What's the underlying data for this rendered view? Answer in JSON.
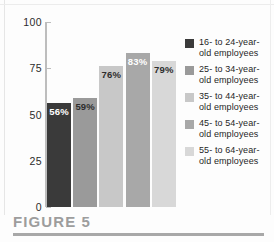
{
  "caption": {
    "label": "FIGURE 5"
  },
  "chart_data": {
    "type": "bar",
    "title": "",
    "xlabel": "",
    "ylabel": "",
    "ylim": [
      0,
      100
    ],
    "yticks": [
      "0",
      "25",
      "50",
      "75",
      "100"
    ],
    "grid": false,
    "legend_position": "right",
    "categories": [
      "16- to 24-year-old employees",
      "25- to 34-year-old employees",
      "35- to 44-year-old employees",
      "45- to 54-year-old employees",
      "55- to 64-year-old employees"
    ],
    "values": [
      56,
      59,
      76,
      83,
      79
    ],
    "data_labels": [
      "56%",
      "59%",
      "76%",
      "83%",
      "79%"
    ],
    "colors": [
      "#3a3a3a",
      "#9a9a9a",
      "#c8c8c8",
      "#a8a8a8",
      "#d8d8d8"
    ],
    "label_contrast": [
      "on-dark",
      "on-light",
      "on-light",
      "on-dark",
      "on-light"
    ]
  },
  "legend": {
    "items": [
      {
        "label": "16- to 24-year-old employees",
        "color": "#3a3a3a"
      },
      {
        "label": "25- to 34-year-old employees",
        "color": "#9a9a9a"
      },
      {
        "label": "35- to 44-year-old employees",
        "color": "#c8c8c8"
      },
      {
        "label": "45- to 54-year-old employees",
        "color": "#a8a8a8"
      },
      {
        "label": "55- to 64-year-old employees",
        "color": "#d8d8d8"
      }
    ]
  }
}
